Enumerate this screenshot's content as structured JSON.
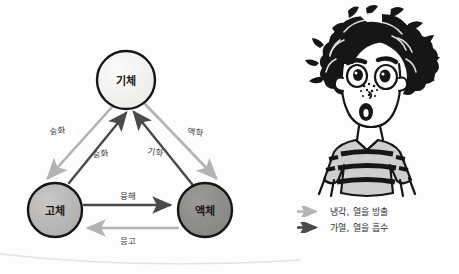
{
  "diagram": {
    "type": "state-change-cycle",
    "nodes": [
      {
        "id": "gas",
        "label": "기체",
        "cx": 126,
        "cy": 80,
        "r": 29,
        "fill": "#f1f0ee"
      },
      {
        "id": "solid",
        "label": "고체",
        "cx": 55,
        "cy": 210,
        "r": 27,
        "fill": "#b9b8b6"
      },
      {
        "id": "liquid",
        "label": "액체",
        "cx": 205,
        "cy": 210,
        "r": 27,
        "fill": "#8e8d8b"
      }
    ],
    "edges": [
      {
        "id": "deposition",
        "label": "승화",
        "from": "gas",
        "to": "solid",
        "kind": "cooling",
        "label_x": 57,
        "label_y": 130
      },
      {
        "id": "sublimation",
        "label": "승화",
        "from": "solid",
        "to": "gas",
        "kind": "heating",
        "label_x": 100,
        "label_y": 153
      },
      {
        "id": "liquefaction",
        "label": "액화",
        "from": "gas",
        "to": "liquid",
        "kind": "cooling",
        "label_x": 196,
        "label_y": 131
      },
      {
        "id": "vaporization",
        "label": "기화",
        "from": "liquid",
        "to": "gas",
        "kind": "heating",
        "label_x": 156,
        "label_y": 151
      },
      {
        "id": "melting",
        "label": "융해",
        "from": "solid",
        "to": "liquid",
        "kind": "heating",
        "label_x": 128,
        "label_y": 195
      },
      {
        "id": "solidification",
        "label": "응고",
        "from": "liquid",
        "to": "solid",
        "kind": "cooling",
        "label_x": 128,
        "label_y": 240
      }
    ]
  },
  "legend": {
    "items": [
      {
        "id": "cooling",
        "arrow": "arrow-right-icon",
        "color": "#b4b3b1",
        "text": "냉각, 열을 방출"
      },
      {
        "id": "heating",
        "arrow": "arrow-right-icon",
        "color": "#4a4a4c",
        "text": "가열, 열을 흡수"
      }
    ]
  },
  "illustration": {
    "name": "surprised-boy-cartoon",
    "description": "만화 소년",
    "colors": {
      "ink": "#161616",
      "skin": "#ffffff",
      "shirt": "#cfcecc"
    }
  },
  "colors": {
    "cooling_arrow": "#b4b3b1",
    "heating_arrow": "#4a4a4c",
    "node_outline": "#161616",
    "text": "#2d2d30",
    "background": "#fdfdfd"
  }
}
